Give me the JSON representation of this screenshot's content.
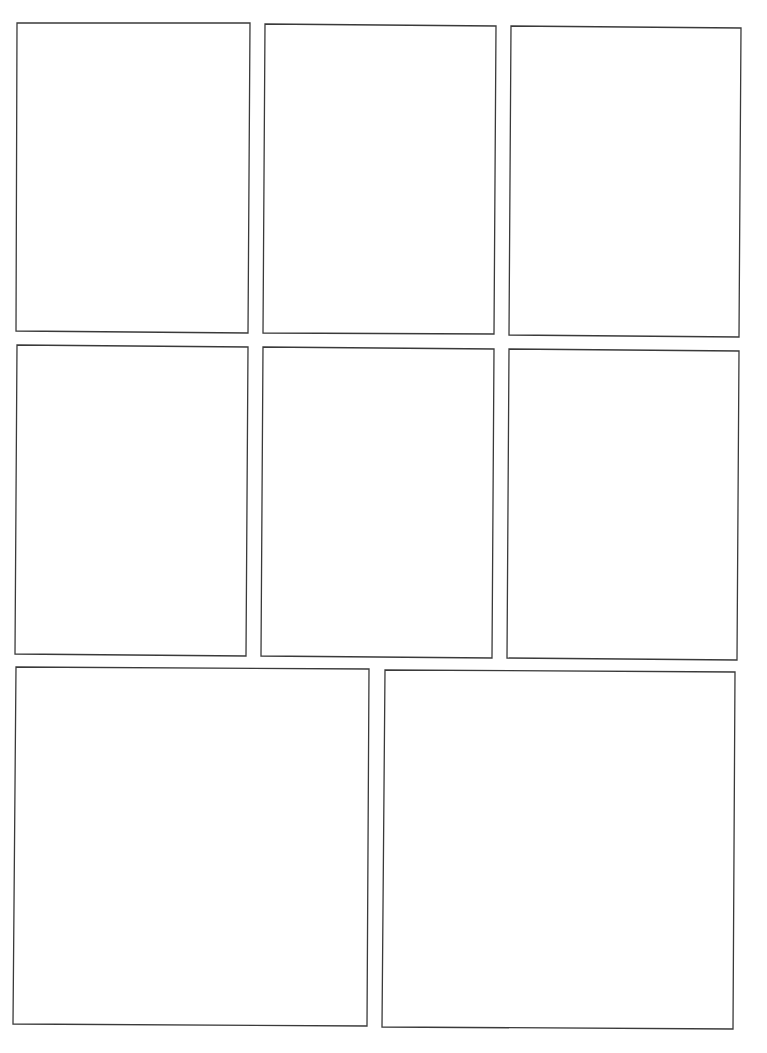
{
  "page": {
    "type": "comic-page-template",
    "title": "Blank comic panel layout",
    "background": "#ffffff",
    "border_color": "#3a3a3a",
    "rows": 3,
    "panel_count": 8
  },
  "panels": [
    {
      "id": "row1-col1",
      "points": "17,23 250,23 248,333 16,331"
    },
    {
      "id": "row1-col2",
      "points": "265,24 496,26 494,334 263,333"
    },
    {
      "id": "row1-col3",
      "points": "511,26 741,28 739,337 509,335"
    },
    {
      "id": "row2-col1",
      "points": "17,345 248,347 246,656 15,654"
    },
    {
      "id": "row2-col2",
      "points": "263,347 494,349 492,658 261,656"
    },
    {
      "id": "row2-col3",
      "points": "509,349 739,351 737,660 507,658"
    },
    {
      "id": "row3-col1",
      "points": "16,667 369,669 367,1026 13,1024"
    },
    {
      "id": "row3-col2",
      "points": "385,670 735,672 733,1029 382,1027"
    }
  ]
}
